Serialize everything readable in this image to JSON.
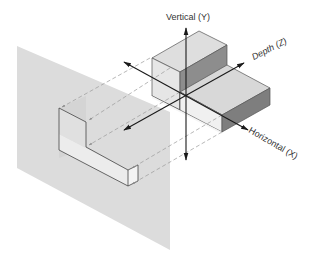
{
  "diagram": {
    "type": "orthographic-projection-illustration",
    "axes": {
      "vertical": {
        "label": "Vertical (Y)"
      },
      "depth": {
        "label": "Depth (Z)"
      },
      "horizontal": {
        "label": "Horizontal (X)"
      }
    },
    "elements": {
      "projection_plane": "gray projection plane",
      "projected_view": "L-shaped projected view",
      "object": "3D stepped block object",
      "projectors": "dashed projection lines with arrowheads"
    },
    "colors": {
      "plane": "#dcdcdc",
      "face_light": "#e8e8e8",
      "face_mid": "#cfcfcf",
      "face_dark": "#8a8a8a",
      "edge": "#444444",
      "axis": "#1a1a1a",
      "projector": "#9a9a9a"
    }
  }
}
